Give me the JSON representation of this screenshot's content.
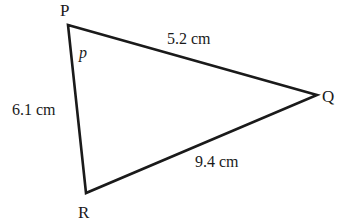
{
  "diagram": {
    "type": "triangle",
    "vertices": {
      "P": {
        "label": "P",
        "x": 68,
        "y": 25
      },
      "Q": {
        "label": "Q",
        "x": 317,
        "y": 95
      },
      "R": {
        "label": "R",
        "x": 86,
        "y": 193
      }
    },
    "sides": {
      "PQ": {
        "label": "5.2 cm"
      },
      "PR": {
        "label": "6.1 cm"
      },
      "QR": {
        "label": "9.4 cm"
      }
    },
    "angle_label": "p",
    "line_color": "#1a1a1a"
  }
}
